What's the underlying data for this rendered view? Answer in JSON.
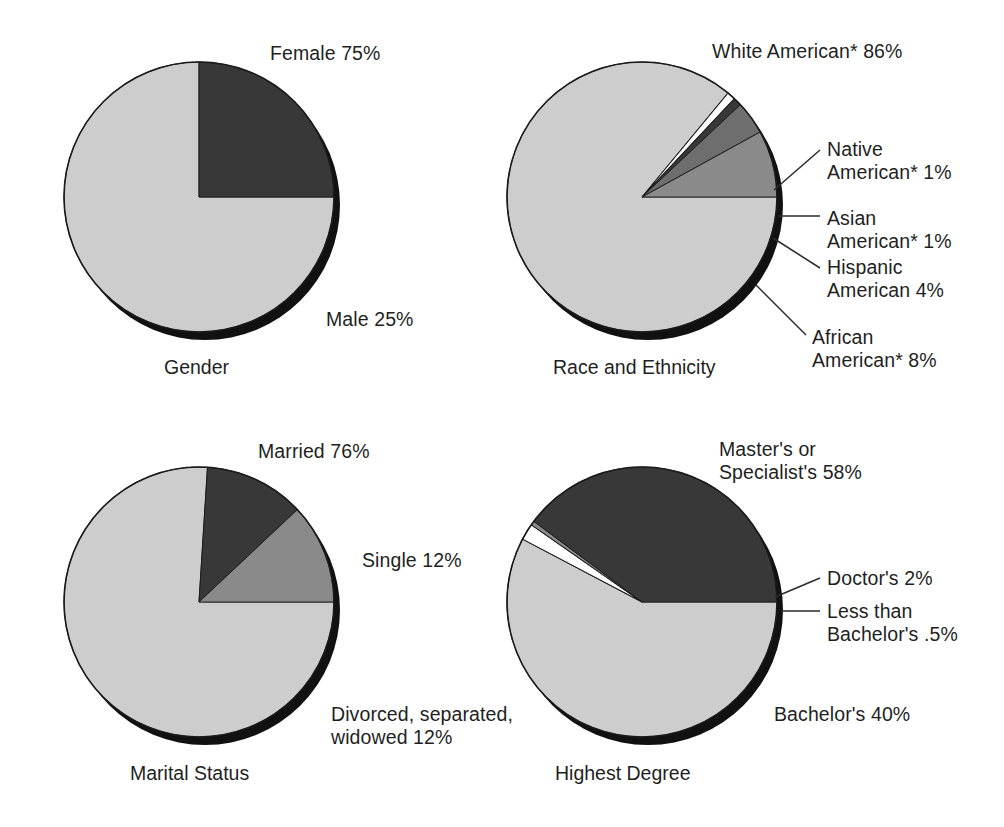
{
  "figure": {
    "background": "#ffffff",
    "text_color": "#1f1f1f",
    "palette": {
      "light_gray": "#cdcdcd",
      "dark_gray": "#383838",
      "mid_gray": "#8a8a8a",
      "slate_gray": "#6e6e6e",
      "white": "#ffffff",
      "shadow": "#111111",
      "outline": "#1a1a1a",
      "leader_line": "#2a2a2a"
    }
  },
  "charts": [
    {
      "id": "gender",
      "caption": "Gender",
      "center": {
        "x": 199,
        "y": 197
      },
      "radius": 135,
      "chart_data": {
        "type": "pie",
        "title": "Gender",
        "legend": "labels",
        "labels": [
          "Female 75%",
          "Male 25%"
        ],
        "categories": [
          "Female",
          "Male"
        ],
        "values": [
          75,
          25
        ],
        "units": "percent",
        "colors": [
          "#cdcdcd",
          "#383838"
        ],
        "start_angle_deg": 90,
        "direction": "clockwise"
      },
      "labels": [
        {
          "name": "label-female",
          "text": "Female 75%",
          "x": 270,
          "y": 42
        },
        {
          "name": "label-male",
          "text": "Male 25%",
          "x": 326,
          "y": 308
        }
      ],
      "caption_pos": {
        "x": 164,
        "y": 356
      }
    },
    {
      "id": "race-and-ethnicity",
      "caption": "Race and Ethnicity",
      "center": {
        "x": 642,
        "y": 197
      },
      "radius": 135,
      "chart_data": {
        "type": "pie",
        "title": "Race and Ethnicity",
        "legend": "labels",
        "labels": [
          "White American* 86%",
          "Native American* 1%",
          "Asian American* 1%",
          "Hispanic American 4%",
          "African American* 8%"
        ],
        "categories": [
          "White American*",
          "Native American*",
          "Asian American*",
          "Hispanic American",
          "African American*"
        ],
        "values": [
          86,
          1,
          1,
          4,
          8
        ],
        "units": "percent",
        "colors": [
          "#cdcdcd",
          "#ffffff",
          "#383838",
          "#6e6e6e",
          "#8a8a8a"
        ],
        "start_angle_deg": 90,
        "direction": "clockwise"
      },
      "labels": [
        {
          "name": "label-white-american",
          "text": "White American* 86%",
          "x": 712,
          "y": 40
        },
        {
          "name": "label-native-american",
          "text": "Native\nAmerican* 1%",
          "x": 827,
          "y": 138
        },
        {
          "name": "label-asian-american",
          "text": "Asian\nAmerican* 1%",
          "x": 827,
          "y": 207
        },
        {
          "name": "label-hispanic-american",
          "text": "Hispanic\nAmerican 4%",
          "x": 827,
          "y": 256
        },
        {
          "name": "label-african-american",
          "text": "African\nAmerican* 8%",
          "x": 812,
          "y": 326
        }
      ],
      "caption_pos": {
        "x": 553,
        "y": 356
      }
    },
    {
      "id": "marital-status",
      "caption": "Marital Status",
      "center": {
        "x": 199,
        "y": 602
      },
      "radius": 135,
      "chart_data": {
        "type": "pie",
        "title": "Marital Status",
        "legend": "labels",
        "labels": [
          "Married 76%",
          "Single 12%",
          "Divorced, separated, widowed 12%"
        ],
        "categories": [
          "Married",
          "Single",
          "Divorced, separated, widowed"
        ],
        "values": [
          76,
          12,
          12
        ],
        "units": "percent",
        "colors": [
          "#cdcdcd",
          "#383838",
          "#8a8a8a"
        ],
        "start_angle_deg": 90,
        "direction": "clockwise"
      },
      "labels": [
        {
          "name": "label-married",
          "text": "Married 76%",
          "x": 258,
          "y": 440
        },
        {
          "name": "label-single",
          "text": "Single 12%",
          "x": 362,
          "y": 549
        },
        {
          "name": "label-divorced",
          "text": "Divorced, separated,\nwidowed 12%",
          "x": 331,
          "y": 703
        }
      ],
      "caption_pos": {
        "x": 130,
        "y": 762
      }
    },
    {
      "id": "highest-degree",
      "caption": "Highest Degree",
      "center": {
        "x": 642,
        "y": 602
      },
      "radius": 135,
      "chart_data": {
        "type": "pie",
        "title": "Highest Degree",
        "legend": "labels",
        "labels": [
          "Master's or Specialist's 58%",
          "Doctor's 2%",
          "Less than Bachelor's .5%",
          "Bachelor's 40%"
        ],
        "categories": [
          "Master's or Specialist's",
          "Doctor's",
          "Less than Bachelor's",
          "Bachelor's"
        ],
        "values": [
          58,
          2,
          0.5,
          40
        ],
        "units": "percent",
        "colors": [
          "#cdcdcd",
          "#ffffff",
          "#8a8a8a",
          "#383838"
        ],
        "start_angle_deg": 90,
        "direction": "clockwise"
      },
      "labels": [
        {
          "name": "label-masters",
          "text": "Master's or\nSpecialist's 58%",
          "x": 719,
          "y": 438
        },
        {
          "name": "label-doctors",
          "text": "Doctor's 2%",
          "x": 827,
          "y": 567
        },
        {
          "name": "label-less-than-bachelors",
          "text": "Less than\nBachelor's .5%",
          "x": 827,
          "y": 600
        },
        {
          "name": "label-bachelors",
          "text": "Bachelor's 40%",
          "x": 774,
          "y": 703
        }
      ],
      "caption_pos": {
        "x": 555,
        "y": 762
      }
    }
  ]
}
